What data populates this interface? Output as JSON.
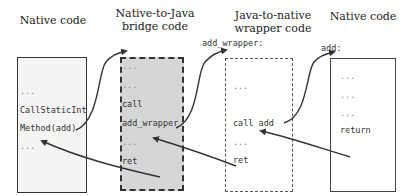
{
  "columns": [
    {
      "title": "Native code",
      "lines": [
        "...",
        "CallStaticInt",
        "Method(add)",
        "..."
      ]
    },
    {
      "title": "Native-to-Java bridge code",
      "title_line1": "Native-to-Java",
      "title_line2": "bridge code",
      "lines": [
        "...",
        "...",
        "call",
        "add_wrapper",
        "...",
        "ret"
      ]
    },
    {
      "title": "Java-to-native wrapper code",
      "title_line1": "Java-to-native",
      "title_line2": "wrapper code",
      "entry_label": "add_wrapper:",
      "lines": [
        "...",
        "call add",
        "...",
        "ret"
      ]
    },
    {
      "title": "Native code",
      "entry_label": "add:",
      "lines": [
        "...",
        "...",
        "...",
        "return"
      ]
    }
  ],
  "colors": {
    "line": "#333333",
    "bridge_fill": "#d6d6d6",
    "native_fill": "#f4f4f4"
  }
}
